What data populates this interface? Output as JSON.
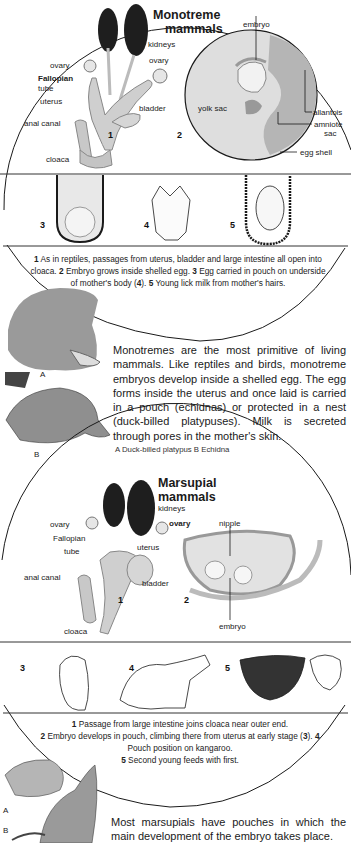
{
  "monotreme": {
    "title_line1": "Monotreme",
    "title_line2": "mammals",
    "fig1": {
      "number": "1",
      "labels": {
        "kidneys": "kidneys",
        "ovary_left": "ovary",
        "ovary_right": "ovary",
        "fallopian_line1": "Fallopian",
        "fallopian_line2": "tube",
        "uterus": "uterus",
        "bladder": "bladder",
        "anal_canal": "anal canal",
        "cloaca": "cloaca"
      }
    },
    "fig2": {
      "number": "2",
      "labels": {
        "embryo": "embryo",
        "yolk_sac": "yolk sac",
        "allantois": "allantois",
        "amniote_line1": "amniote",
        "amniote_line2": "sac",
        "egg_shell": "egg shell"
      }
    },
    "strip_numbers": [
      "3",
      "4",
      "5"
    ],
    "caption": {
      "n1": "1",
      "t1": " As in reptiles, passages from uterus, bladder and large intestine all open into cloaca. ",
      "n2": "2",
      "t2": " Embryo grows inside shelled egg. ",
      "n3": "3",
      "t3": " Egg carried in pouch on underside of mother's body (",
      "n4": "4",
      "t4": "). ",
      "n5": "5",
      "t5": " Young lick milk from mother's hairs."
    },
    "body": "Monotremes are the most primitive of living mammals. Like reptiles and birds, monotreme embryos develop inside a shelled egg. The egg forms inside the uterus and once laid is carried in a pouch (echidnas) or protected in a nest (duck-billed platypuses). Milk is secreted through pores in the mother's skin.",
    "key": "A  Duck-billed platypus   B  Echidna",
    "animal_letters": [
      "A",
      "B"
    ]
  },
  "marsupial": {
    "title_line1": "Marsupial",
    "title_line2": "mammals",
    "fig1": {
      "number": "1",
      "labels": {
        "kidneys": "kidneys",
        "ovary_left": "ovary",
        "ovary_right": "ovary",
        "fallopian_line1": "Fallopian",
        "fallopian_line2": "tube",
        "uterus": "uterus",
        "bladder": "bladder",
        "anal_canal": "anal canal",
        "cloaca": "cloaca"
      }
    },
    "fig2": {
      "number": "2",
      "labels": {
        "nipple": "nipple",
        "embryo": "embryo"
      }
    },
    "strip_numbers": [
      "3",
      "4",
      "5"
    ],
    "caption": {
      "n1": "1",
      "t1": " Passage from large intestine joins cloaca near outer end.",
      "n2": "2",
      "t2": " Embryo develops in pouch, climbing there from uterus at early stage (",
      "n3": "3",
      "t3": "). ",
      "n4": "4",
      "t4": " Pouch position on kangaroo.",
      "n5": "5",
      "t5": " Second young feeds with first."
    },
    "body": "Most marsupials have pouches in which the main development of the embryo takes place.",
    "animal_letters": [
      "A",
      "B"
    ]
  },
  "colors": {
    "ink": "#1a1a1a",
    "organ": "#cfcfcf",
    "kidney": "#1e1e1e",
    "egg": "#dcdcdc",
    "shade": "#a9a9a9"
  }
}
